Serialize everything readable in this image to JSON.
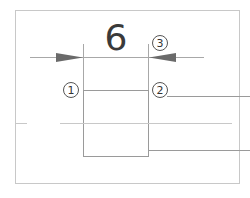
{
  "diagram": {
    "dimension_value": "6",
    "callouts": [
      {
        "id": "callout-1",
        "label": "1"
      },
      {
        "id": "callout-2",
        "label": "2"
      },
      {
        "id": "callout-3",
        "label": "3"
      }
    ],
    "colors": {
      "frame": "#c8c8c8",
      "line": "#9a9a9a",
      "arrow": "#6a6a6a",
      "text": "#3a3a3a"
    }
  }
}
